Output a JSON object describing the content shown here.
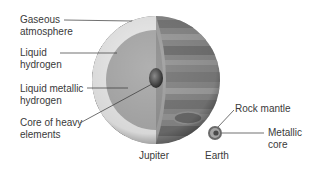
{
  "diagram": {
    "jupiter": {
      "name": "Jupiter",
      "layers": [
        {
          "line1": "Gaseous",
          "line2": "atmosphere"
        },
        {
          "line1": "Liquid",
          "line2": "hydrogen"
        },
        {
          "line1": "Liquid metallic",
          "line2": "hydrogen"
        },
        {
          "line1": "Core of heavy",
          "line2": "elements"
        }
      ]
    },
    "earth": {
      "name": "Earth",
      "layers": [
        {
          "line1": "Rock mantle",
          "line2": ""
        },
        {
          "line1": "Metallic",
          "line2": "core"
        }
      ]
    }
  }
}
